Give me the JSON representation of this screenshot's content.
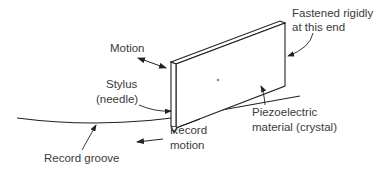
{
  "labels": {
    "motion": "Motion",
    "stylus_line1": "Stylus",
    "stylus_line2": "(needle)",
    "fastened_line1": "Fastened rigidly",
    "fastened_line2": "at this end",
    "piezo_line1": "Piezoelectric",
    "piezo_line2": "material (crystal)",
    "record_motion_line1": "Record",
    "record_motion_line2": "motion",
    "record_groove": "Record groove"
  },
  "colors": {
    "line": "#222222",
    "text": "#3a3a3a",
    "background": "#ffffff"
  }
}
